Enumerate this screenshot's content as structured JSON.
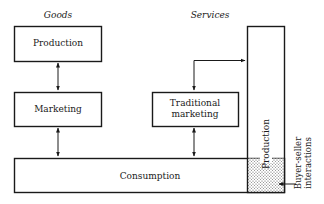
{
  "diagram": {
    "categories": {
      "goods": "Goods",
      "services": "Services"
    },
    "goods": {
      "production": "Production",
      "marketing": "Marketing"
    },
    "services": {
      "production": "Production",
      "traditional_marketing_line1": "Traditional",
      "traditional_marketing_line2": "marketing"
    },
    "consumption": "Consumption",
    "buyer_seller_line1": "Buyer-seller",
    "buyer_seller_line2": "interactions",
    "colors": {
      "stroke": "#1a1a1a",
      "background": "#ffffff"
    }
  }
}
